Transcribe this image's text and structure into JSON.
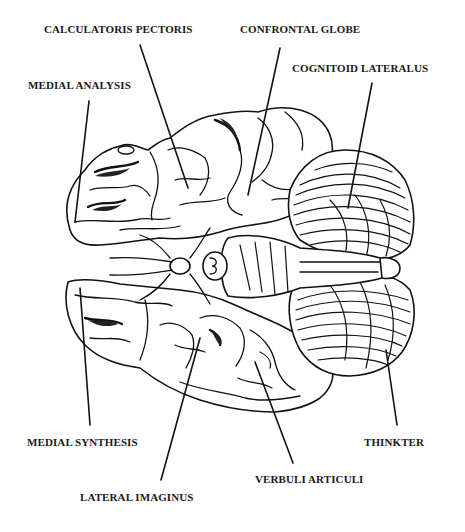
{
  "diagram": {
    "labels": [
      {
        "id": "calculatoris-pectoris",
        "text": "CALCULATORIS PECTORIS"
      },
      {
        "id": "confrontal-globe",
        "text": "CONFRONTAL GLOBE"
      },
      {
        "id": "medial-analysis",
        "text": "MEDIAL ANALYSIS"
      },
      {
        "id": "cognitoid-lateralus",
        "text": "COGNITOID LATERALUS"
      },
      {
        "id": "medial-synthesis",
        "text": "MEDIAL SYNTHESIS"
      },
      {
        "id": "thinkter",
        "text": "THINKTER"
      },
      {
        "id": "verbuli-articuli",
        "text": "VERBULI ARTICULI"
      },
      {
        "id": "lateral-imaginus",
        "text": "LATERAL IMAGINUS"
      }
    ]
  }
}
